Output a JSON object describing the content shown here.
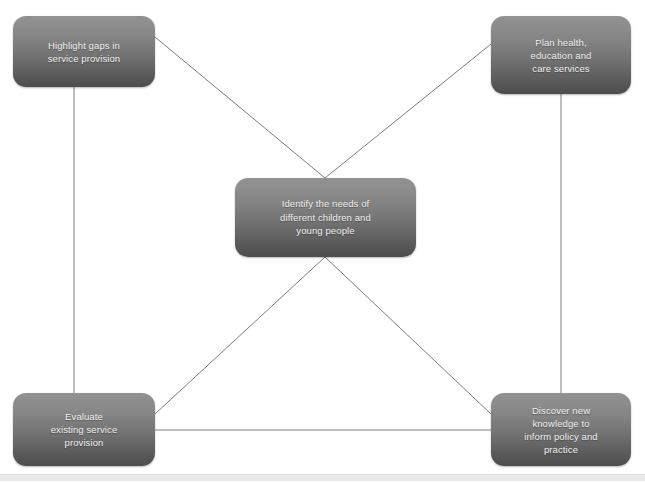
{
  "diagram": {
    "background_color": "#ffffff",
    "node_gradient_top": "#939293",
    "node_gradient_bottom": "#4e4d4e",
    "node_text_color": "#f2f2f2",
    "edge_color": "#7c7c7c",
    "nodes": [
      {
        "id": "highlight-gaps",
        "label": "Highlight gaps in\nservice provision",
        "x": 13,
        "y": 16,
        "width": 142,
        "height": 71
      },
      {
        "id": "plan-services",
        "label": "Plan health,\neducation and\ncare services",
        "x": 491,
        "y": 16,
        "width": 140,
        "height": 78
      },
      {
        "id": "identify-needs",
        "label": "Identify the needs of\ndifferent children and\nyoung people",
        "x": 235,
        "y": 178,
        "width": 181,
        "height": 79
      },
      {
        "id": "evaluate-services",
        "label": "Evaluate\nexisting service\nprovision",
        "x": 13,
        "y": 393,
        "width": 142,
        "height": 73
      },
      {
        "id": "discover-knowledge",
        "label": "Discover new\nknowledge to\ninform policy and\npractice",
        "x": 491,
        "y": 393,
        "width": 140,
        "height": 73
      }
    ],
    "edges": [
      {
        "id": "edge-highlight-to-center",
        "from": "highlight-gaps",
        "to": "identify-needs",
        "x1": 155,
        "y1": 37,
        "x2": 325,
        "y2": 178
      },
      {
        "id": "edge-plan-to-center",
        "from": "plan-services",
        "to": "identify-needs",
        "x1": 491,
        "y1": 44,
        "x2": 325,
        "y2": 178
      },
      {
        "id": "edge-center-to-evaluate",
        "from": "identify-needs",
        "to": "evaluate-services",
        "x1": 325,
        "y1": 257,
        "x2": 155,
        "y2": 414
      },
      {
        "id": "edge-center-to-discover",
        "from": "identify-needs",
        "to": "discover-knowledge",
        "x1": 325,
        "y1": 257,
        "x2": 491,
        "y2": 414
      },
      {
        "id": "edge-highlight-to-evaluate",
        "from": "highlight-gaps",
        "to": "evaluate-services",
        "x1": 74,
        "y1": 87,
        "x2": 74,
        "y2": 393
      },
      {
        "id": "edge-plan-to-discover",
        "from": "plan-services",
        "to": "discover-knowledge",
        "x1": 561,
        "y1": 94,
        "x2": 561,
        "y2": 393
      },
      {
        "id": "edge-evaluate-to-discover",
        "from": "evaluate-services",
        "to": "discover-knowledge",
        "x1": 155,
        "y1": 430,
        "x2": 491,
        "y2": 430
      }
    ],
    "footer_rule": {
      "y": 474,
      "color": "#e9e9e9"
    }
  }
}
